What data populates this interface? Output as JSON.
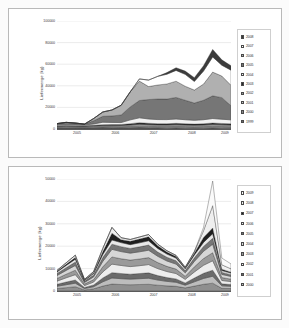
{
  "page": {
    "background_color": "#fbfbfb",
    "frame_border_color": "#b9b9b9"
  },
  "chart_data": [
    {
      "id": "top",
      "type": "area",
      "stacked": true,
      "title": "",
      "ylabel": "Liefermenge (kg)",
      "xlabel": "",
      "ylim": [
        0,
        100000
      ],
      "yticks": [
        0,
        20000,
        40000,
        60000,
        80000,
        100000
      ],
      "ytick_labels": [
        "0",
        "20000",
        "40000",
        "60000",
        "80000",
        "100000"
      ],
      "grid": true,
      "legend_position": "right",
      "xtick_labels": [
        "2005",
        "2006",
        "2007",
        "2008",
        "2009"
      ],
      "xtick_positions": [
        0.115,
        0.335,
        0.555,
        0.775,
        0.965
      ],
      "categories": [
        "2005-Q1",
        "2005-Q2",
        "2005-Q3",
        "2005-Q4",
        "2006-Q1",
        "2006-Q2",
        "2006-Q3",
        "2006-Q4",
        "2007-Q1",
        "2007-Q2",
        "2007-Q3",
        "2007-Q4",
        "2008-Q1",
        "2008-Q2",
        "2008-Q3",
        "2008-Q4",
        "2009-Q1",
        "2009-Q2",
        "2009-Q3",
        "2009-Q4"
      ],
      "series": [
        {
          "name": "1999",
          "color": "#6e6e6e",
          "values": [
            900,
            950,
            900,
            850,
            900,
            950,
            900,
            850,
            900,
            950,
            900,
            850,
            800,
            850,
            800,
            750,
            800,
            850,
            800,
            750
          ]
        },
        {
          "name": "2000",
          "color": "#8a8a8a",
          "values": [
            700,
            750,
            700,
            700,
            750,
            800,
            750,
            700,
            750,
            800,
            750,
            700,
            700,
            750,
            700,
            650,
            700,
            750,
            700,
            650
          ]
        },
        {
          "name": "2001",
          "color": "#c6c6c6",
          "values": [
            600,
            650,
            600,
            600,
            650,
            700,
            650,
            600,
            700,
            800,
            750,
            700,
            700,
            750,
            700,
            650,
            700,
            800,
            750,
            700
          ]
        },
        {
          "name": "2002",
          "color": "#9c9c9c",
          "values": [
            500,
            550,
            500,
            500,
            700,
            900,
            1000,
            1100,
            1400,
            1800,
            1600,
            1500,
            1500,
            1600,
            1500,
            1400,
            1500,
            1700,
            1600,
            1500
          ]
        },
        {
          "name": "2003",
          "color": "#2a2a2a",
          "values": [
            300,
            350,
            300,
            300,
            500,
            700,
            800,
            900,
            1200,
            1500,
            1300,
            1200,
            1200,
            1300,
            1200,
            1100,
            1200,
            1400,
            1300,
            1200
          ]
        },
        {
          "name": "2004",
          "color": "#f2f2f2",
          "values": [
            800,
            900,
            800,
            700,
            1200,
            2200,
            2000,
            1800,
            3500,
            4500,
            4000,
            3800,
            3800,
            4000,
            3700,
            3500,
            3700,
            4200,
            3900,
            3700
          ]
        },
        {
          "name": "2005",
          "color": "#767676",
          "values": [
            1200,
            2000,
            1700,
            900,
            3000,
            5500,
            6000,
            7000,
            12000,
            16000,
            18000,
            19000,
            19000,
            20000,
            18000,
            16000,
            18000,
            21000,
            20000,
            13000
          ]
        },
        {
          "name": "2006",
          "color": "#b0b0b0",
          "values": [
            0,
            0,
            0,
            0,
            2000,
            4000,
            5500,
            9000,
            14000,
            18000,
            12000,
            13000,
            14000,
            15000,
            13000,
            12000,
            15000,
            22000,
            20000,
            19000
          ]
        },
        {
          "name": "2007",
          "color": "#ffffff",
          "values": [
            0,
            0,
            0,
            0,
            0,
            0,
            0,
            0,
            0,
            2000,
            6000,
            8000,
            9000,
            10000,
            11000,
            8000,
            12000,
            14000,
            10000,
            14000
          ]
        },
        {
          "name": "2008",
          "color": "#3c3c3c",
          "values": [
            0,
            0,
            0,
            0,
            0,
            0,
            0,
            0,
            0,
            0,
            0,
            0,
            1500,
            2500,
            3000,
            3500,
            5000,
            7000,
            5000,
            4000
          ]
        }
      ],
      "legend_entries": [
        "2008",
        "2007",
        "2006",
        "2005",
        "2004",
        "2003",
        "2002",
        "2001",
        "2000",
        "1999"
      ]
    },
    {
      "id": "bottom",
      "type": "area",
      "stacked": true,
      "title": "",
      "ylabel": "Liefermenge (kg)",
      "xlabel": "",
      "ylim": [
        0,
        50000
      ],
      "yticks": [
        0,
        10000,
        20000,
        30000,
        40000,
        50000
      ],
      "ytick_labels": [
        "0",
        "10000",
        "20000",
        "30000",
        "40000",
        "50000"
      ],
      "grid": true,
      "legend_position": "right",
      "xtick_labels": [
        "2005",
        "2006",
        "2007",
        "2008",
        "2009"
      ],
      "xtick_positions": [
        0.115,
        0.335,
        0.555,
        0.775,
        0.965
      ],
      "categories": [
        "2005-Q1",
        "2005-Q2",
        "2005-Q3",
        "2005-Q4",
        "2006-Q1",
        "2006-Q2",
        "2006-Q3",
        "2006-Q4",
        "2007-Q1",
        "2007-Q2",
        "2007-Q3",
        "2007-Q4",
        "2008-Q1",
        "2008-Q2",
        "2008-Q3",
        "2008-Q4",
        "2009-Q1",
        "2009-Q2",
        "2009-Q3",
        "2009-Q4"
      ],
      "series": [
        {
          "name": "1999",
          "color": "#8f8f8f",
          "values": [
            1100,
            1500,
            1900,
            500,
            1000,
            2200,
            3100,
            2900,
            2800,
            2900,
            3000,
            2600,
            2300,
            2100,
            1400,
            2200,
            3000,
            3500,
            1200,
            1100
          ]
        },
        {
          "name": "2000",
          "color": "#bdbdbd",
          "values": [
            1000,
            1300,
            1600,
            600,
            900,
            1900,
            2700,
            2600,
            2500,
            2600,
            2700,
            2300,
            2000,
            1800,
            1200,
            1900,
            2600,
            3100,
            1100,
            1000
          ]
        },
        {
          "name": "2001",
          "color": "#6b6b6b",
          "values": [
            900,
            1200,
            1400,
            500,
            800,
            1700,
            2400,
            2300,
            2200,
            2300,
            2400,
            2000,
            1700,
            1500,
            1000,
            1700,
            2300,
            2700,
            900,
            800
          ]
        },
        {
          "name": "2002",
          "color": "#ededed",
          "values": [
            1400,
            1900,
            2400,
            800,
            1300,
            2700,
            3800,
            3600,
            3400,
            3500,
            3700,
            3100,
            2700,
            2400,
            1600,
            2700,
            3600,
            4200,
            1500,
            1300
          ]
        },
        {
          "name": "2003",
          "color": "#9a9a9a",
          "values": [
            1200,
            1600,
            2000,
            700,
            1100,
            2300,
            3200,
            3000,
            2900,
            3000,
            3100,
            2700,
            2300,
            2000,
            1400,
            2300,
            3000,
            3600,
            1300,
            1100
          ]
        },
        {
          "name": "2004",
          "color": "#d6d6d6",
          "values": [
            1300,
            1700,
            2100,
            700,
            1200,
            2400,
            3400,
            3200,
            3100,
            3200,
            3300,
            2800,
            2400,
            2200,
            1500,
            2400,
            3200,
            3800,
            1400,
            1200
          ]
        },
        {
          "name": "2005",
          "color": "#777777",
          "values": [
            900,
            1200,
            1500,
            500,
            800,
            1700,
            2300,
            2200,
            2100,
            2200,
            2300,
            1900,
            1700,
            1500,
            1000,
            1600,
            2200,
            2600,
            900,
            800
          ]
        },
        {
          "name": "2006",
          "color": "#e8e8e8",
          "values": [
            700,
            1000,
            1300,
            400,
            700,
            1400,
            1900,
            1800,
            1700,
            1800,
            1900,
            1600,
            1400,
            1200,
            800,
            1300,
            1800,
            2100,
            800,
            700
          ]
        },
        {
          "name": "2007",
          "color": "#1f1f1f",
          "values": [
            300,
            500,
            700,
            200,
            400,
            1200,
            3000,
            1300,
            1500,
            1700,
            1800,
            1200,
            900,
            700,
            400,
            800,
            2200,
            2500,
            600,
            400
          ]
        },
        {
          "name": "2008",
          "color": "#efefef",
          "values": [
            400,
            700,
            1100,
            300,
            500,
            1500,
            2600,
            900,
            800,
            900,
            1000,
            700,
            600,
            500,
            300,
            700,
            3000,
            10000,
            2000,
            1500
          ]
        },
        {
          "name": "2009",
          "color": "#fafafa",
          "values": [
            0,
            0,
            0,
            0,
            0,
            0,
            0,
            0,
            0,
            0,
            0,
            0,
            0,
            0,
            0,
            0,
            1500,
            11000,
            3000,
            2200
          ]
        }
      ],
      "legend_entries": [
        "2009",
        "2008",
        "2007",
        "2006",
        "2005",
        "2004",
        "2003",
        "2002",
        "2001",
        "2000"
      ]
    }
  ]
}
